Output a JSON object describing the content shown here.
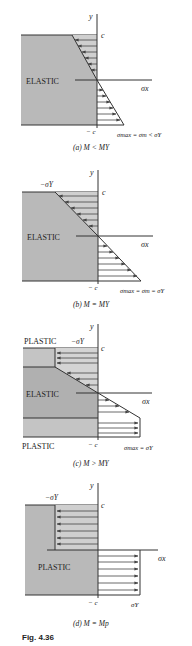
{
  "figure": {
    "label": "Fig. 4.36",
    "colors": {
      "shade": "#b9b9b9",
      "stroke": "#333333",
      "text": "#222222"
    }
  },
  "panels": [
    {
      "id": "a",
      "caption": "(a) M < M_Y",
      "caption_text": "(a) M < MY",
      "axis_y": "y",
      "axis_x": "σx",
      "top_label": "c",
      "bottom_label": "− c",
      "zone_labels": [
        "ELASTIC"
      ],
      "stress_label": "σmax = σm < σY"
    },
    {
      "id": "b",
      "caption_text": "(b) M = MY",
      "axis_y": "y",
      "axis_x": "σx",
      "top_label": "c",
      "bottom_label": "− c",
      "neg_yield_label": "−σY",
      "zone_labels": [
        "ELASTIC"
      ],
      "stress_label": "σmax = σm = σY"
    },
    {
      "id": "c",
      "caption_text": "(c) M > MY",
      "axis_y": "y",
      "axis_x": "σx",
      "top_label": "c",
      "bottom_label": "− c",
      "neg_yield_label": "−σY",
      "zone_labels": [
        "PLASTIC",
        "ELASTIC",
        "PLASTIC"
      ],
      "stress_label": "σmax = σY"
    },
    {
      "id": "d",
      "caption_text": "(d) M = Mp",
      "axis_y": "y",
      "axis_x": "σx",
      "top_label": "c",
      "bottom_label": "− c",
      "neg_yield_label": "−σY",
      "zone_labels": [
        "PLASTIC"
      ],
      "stress_label": "σY"
    }
  ]
}
